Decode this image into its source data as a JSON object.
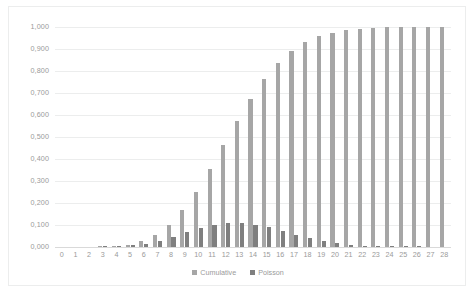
{
  "chart_data": {
    "type": "bar",
    "title": "",
    "subtitle": "",
    "xlabel": "",
    "ylabel": "",
    "grid": true,
    "legend_position": "bottom",
    "ylim": [
      0,
      1.0
    ],
    "y_ticks": [
      0,
      0.1,
      0.2,
      0.3,
      0.4,
      0.5,
      0.6,
      0.7,
      0.8,
      0.9,
      1.0
    ],
    "y_tick_labels": [
      "0,000",
      "0,100",
      "0,200",
      "0,300",
      "0,400",
      "0,500",
      "0,600",
      "0,700",
      "0,800",
      "0,900",
      "1,000"
    ],
    "categories": [
      "0",
      "1",
      "2",
      "3",
      "4",
      "5",
      "6",
      "7",
      "8",
      "9",
      "10",
      "11",
      "12",
      "13",
      "14",
      "15",
      "16",
      "17",
      "18",
      "19",
      "20",
      "21",
      "22",
      "23",
      "24",
      "25",
      "26",
      "27",
      "28"
    ],
    "x_tick_labels": [
      "0",
      "1",
      "2",
      "3",
      "4",
      "5",
      "6",
      "7",
      "8",
      "9",
      "10",
      "11",
      "12",
      "13",
      "14",
      "15",
      "16",
      "17",
      "18",
      "19",
      "20",
      "21",
      "22",
      "23",
      "24",
      "25",
      "26",
      "27",
      "28"
    ],
    "series": [
      {
        "name": "Cumulative",
        "color": "#a6a6a6",
        "values": [
          0.0,
          0.0,
          0.0,
          0.001,
          0.004,
          0.011,
          0.026,
          0.054,
          0.1,
          0.166,
          0.252,
          0.353,
          0.463,
          0.573,
          0.675,
          0.764,
          0.835,
          0.89,
          0.93,
          0.957,
          0.975,
          0.986,
          0.992,
          0.996,
          0.998,
          0.999,
          1.0,
          1.0,
          1.0
        ]
      },
      {
        "name": "Poisson",
        "color": "#7f7f7f",
        "values": [
          0.0,
          0.0,
          0.0,
          0.001,
          0.003,
          0.007,
          0.015,
          0.028,
          0.046,
          0.066,
          0.086,
          0.101,
          0.11,
          0.11,
          0.102,
          0.089,
          0.072,
          0.055,
          0.04,
          0.027,
          0.018,
          0.011,
          0.006,
          0.004,
          0.002,
          0.001,
          0.001,
          0.0,
          0.0
        ]
      }
    ]
  },
  "legend": {
    "items": [
      {
        "label": "Cumulative",
        "color": "#a6a6a6"
      },
      {
        "label": "Poisson",
        "color": "#7f7f7f"
      }
    ]
  }
}
